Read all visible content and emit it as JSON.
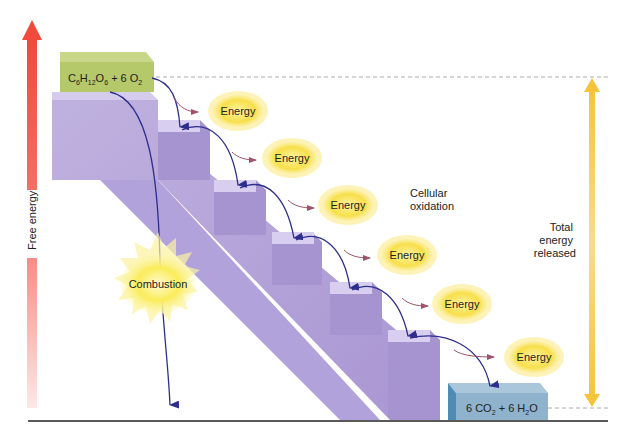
{
  "diagram": {
    "type": "energy staircase",
    "y_axis_label": "Free energy",
    "reactants": {
      "base": "C",
      "sub1": "6",
      "h": "H",
      "sub2": "12",
      "o": "O",
      "sub3": "6",
      "plus": " + 6 O",
      "sub4": "2"
    },
    "products": {
      "text1": "6 CO",
      "sub1": "2",
      "text2": " + 6 H",
      "sub2": "2",
      "text3": "O"
    },
    "combustion_label": "Combustion",
    "cellular_oxidation_label_line1": "Cellular",
    "cellular_oxidation_label_line2": "oxidation",
    "total_energy_line1": "Total",
    "total_energy_line2": "energy",
    "total_energy_line3": "released",
    "energy_bursts": [
      {
        "label": "Energy"
      },
      {
        "label": "Energy"
      },
      {
        "label": "Energy"
      },
      {
        "label": "Energy"
      },
      {
        "label": "Energy"
      },
      {
        "label": "Energy"
      }
    ],
    "colors": {
      "reactant_box": "#b5c96a",
      "product_box": "#8fb3cc",
      "staircase": "#b5a6d8",
      "axis_arrow": "#ee4b3e",
      "total_arrow": "#f5c842",
      "path_arrow": "#2e2e8c",
      "energy_burst": "#f7e25a"
    }
  }
}
